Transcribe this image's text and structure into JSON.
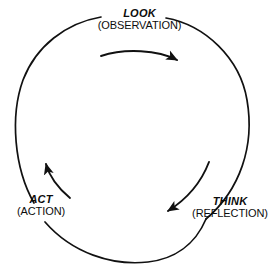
{
  "diagram": {
    "type": "cyclical-process",
    "direction": "clockwise",
    "background_color": "#ffffff",
    "stroke_color": "#111111",
    "nodes": [
      {
        "id": "look",
        "title": "LOOK",
        "subtitle": "(OBSERVATION)",
        "position": "top"
      },
      {
        "id": "think",
        "title": "THINK",
        "subtitle": "(REFLECTION)",
        "position": "bottom-right"
      },
      {
        "id": "act",
        "title": "ACT",
        "subtitle": "(ACTION)",
        "position": "bottom-left"
      }
    ],
    "arrows": [
      {
        "id": "look-to-think",
        "from": "look",
        "to": "think"
      },
      {
        "id": "think-to-act",
        "from": "think",
        "to": "act"
      },
      {
        "id": "act-to-look",
        "from": "act",
        "to": "look"
      }
    ]
  }
}
